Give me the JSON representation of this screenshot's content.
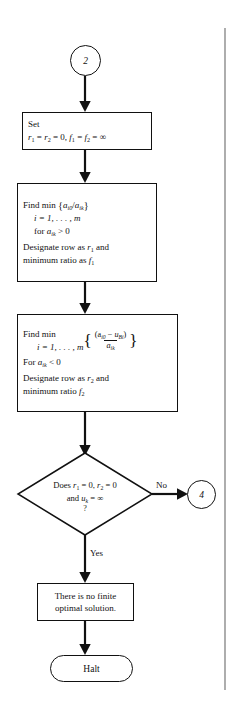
{
  "diagram": {
    "type": "flowchart",
    "line_color": "#111111",
    "background": "#ffffff"
  },
  "nodes": {
    "entry_connector": {
      "label": "2",
      "shape": "circle"
    },
    "exit_connector": {
      "label": "4",
      "shape": "circle"
    },
    "set_box": {
      "line1": "Set",
      "line2_r": "r",
      "line2_sub1": "1",
      "line2_eq1": " = ",
      "line2_r2": "r",
      "line2_sub2": "2",
      "line2_eq2": " = 0, ",
      "line2_f1": "f",
      "line2_sub3": "1",
      "line2_eq3": " = ",
      "line2_f2": "f",
      "line2_sub4": "2",
      "line2_eq4": " = ",
      "line2_inf": "∞"
    },
    "find_min_ratio_box": {
      "line1_find": "Find  min",
      "line1_open": "{",
      "line1_a": "a",
      "line1_sub_i0": "i0",
      "line1_slash": "/",
      "line1_a2": "a",
      "line1_sub_ik": "ik",
      "line1_close": "}",
      "line2": "i = 1, . . . , m",
      "line3_for": "for ",
      "line3_a": "a",
      "line3_sub": "ik",
      "line3_rel": " > 0",
      "line4a": "Designate row as ",
      "line4_r": "r",
      "line4_sub": "1",
      "line4b": " and",
      "line5a": "minimum ratio as ",
      "line5_f": "f",
      "line5_sub": "1"
    },
    "find_min_dual_box": {
      "line1": "Find min",
      "line2_index": "i = 1, . . . , m",
      "frac_num_a": "a",
      "frac_num_sub": "i0",
      "frac_num_minus": " − ",
      "frac_num_u": "u",
      "frac_num_usub": "Bi",
      "frac_den_a": "a",
      "frac_den_sub": "ik",
      "line3_for": "For ",
      "line3_a": "a",
      "line3_sub": "ik",
      "line3_rel": " < 0",
      "line4a": "Designate row as ",
      "line4_r": "r",
      "line4_sub": "2",
      "line4b": " and",
      "line5a": "minimum ratio ",
      "line5_f": "f",
      "line5_sub": "2"
    },
    "decision": {
      "line1_does": "Does ",
      "line1_r1": "r",
      "line1_sub1": "1",
      "line1_eq1": " = 0, ",
      "line1_r2": "r",
      "line1_sub2": "2",
      "line1_eq2": " = 0",
      "line2_and": "and ",
      "line2_u": "u",
      "line2_sub": "k",
      "line2_eq": " = ",
      "line2_inf": "∞",
      "line3_q": "?"
    },
    "no_finite_box": {
      "line1": "There is no finite",
      "line2": "optimal solution."
    },
    "halt": {
      "label": "Halt",
      "shape": "stadium"
    }
  },
  "edges": {
    "no_label": "No",
    "yes_label": "Yes"
  }
}
